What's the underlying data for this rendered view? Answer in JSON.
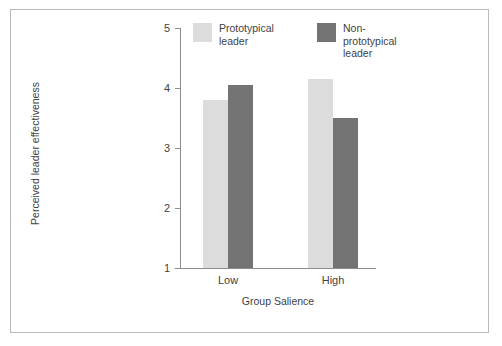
{
  "chart_data": {
    "type": "bar",
    "title": "",
    "xlabel": "Group Salience",
    "ylabel": "Perceived leader effectiveness",
    "categories": [
      "Low",
      "High"
    ],
    "series": [
      {
        "name": "Prototypical leader",
        "values": [
          3.8,
          4.15
        ],
        "color": "#dcdcdc"
      },
      {
        "name": "Non-prototypical leader",
        "values": [
          4.05,
          3.5
        ],
        "color": "#737373"
      }
    ],
    "ylim": [
      1,
      5
    ],
    "yticks": [
      "1",
      "2",
      "3",
      "4",
      "5"
    ],
    "grid": false,
    "legend_position": "top"
  },
  "legend": {
    "entries": [
      {
        "label_line1": "Prototypical",
        "label_line2": "leader"
      },
      {
        "label_line1": "Non-prototypical",
        "label_line2": "leader"
      }
    ]
  },
  "colors": {
    "prototypical": "#dcdcdc",
    "non_prototypical": "#737373",
    "axis": "#8d8d8d",
    "frame": "#b9b9b9",
    "text": "#3f3f3f",
    "background": "#ffffff"
  }
}
